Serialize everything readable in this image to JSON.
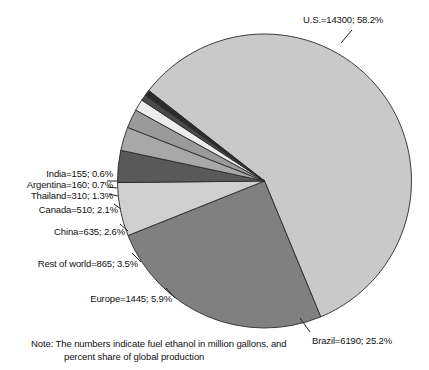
{
  "chart_data": {
    "type": "pie",
    "title": "",
    "subtitle": "",
    "xlabel": "",
    "ylabel": "",
    "legend_position": "callout-labels",
    "units": "million gallons",
    "total": 24570,
    "categories": [
      "U.S.",
      "Brazil",
      "Europe",
      "Rest of world",
      "China",
      "Canada",
      "Thailand",
      "Argentina",
      "India"
    ],
    "values": [
      14300,
      6190,
      1445,
      865,
      635,
      510,
      310,
      160,
      155
    ],
    "percents": [
      58.2,
      25.2,
      5.9,
      3.5,
      2.6,
      2.1,
      1.3,
      0.7,
      0.6
    ],
    "colors": [
      "#c9c9c9",
      "#808080",
      "#cfcfcf",
      "#595959",
      "#a8a8a8",
      "#9a9a9a",
      "#ececec",
      "#4a4a4a",
      "#2b2b2b"
    ],
    "slices": [
      {
        "name": "U.S.",
        "label": "U.S.=14300; 58.2%",
        "value": 14300,
        "percent": 58.2,
        "color": "#c9c9c9"
      },
      {
        "name": "Brazil",
        "label": "Brazil=6190; 25.2%",
        "value": 6190,
        "percent": 25.2,
        "color": "#808080"
      },
      {
        "name": "Europe",
        "label": "Europe=1445; 5.9%",
        "value": 1445,
        "percent": 5.9,
        "color": "#cfcfcf"
      },
      {
        "name": "Rest of world",
        "label": "Rest of world=865; 3.5%",
        "value": 865,
        "percent": 3.5,
        "color": "#595959"
      },
      {
        "name": "China",
        "label": "China=635; 2.6%",
        "value": 635,
        "percent": 2.6,
        "color": "#a8a8a8"
      },
      {
        "name": "Canada",
        "label": "Canada=510; 2.1%",
        "value": 510,
        "percent": 2.1,
        "color": "#9a9a9a"
      },
      {
        "name": "Thailand",
        "label": "Thailand=310; 1.3%",
        "value": 310,
        "percent": 1.3,
        "color": "#ececec"
      },
      {
        "name": "Argentina",
        "label": "Argentina=160; 0.7%",
        "value": 160,
        "percent": 0.7,
        "color": "#4a4a4a"
      },
      {
        "name": "India",
        "label": "India=155; 0.6%",
        "value": 155,
        "percent": 0.6,
        "color": "#2b2b2b"
      }
    ]
  },
  "note": {
    "line1": "Note:  The numbers indicate fuel ethanol in million gallons, and",
    "line2": "percent share of global production"
  }
}
